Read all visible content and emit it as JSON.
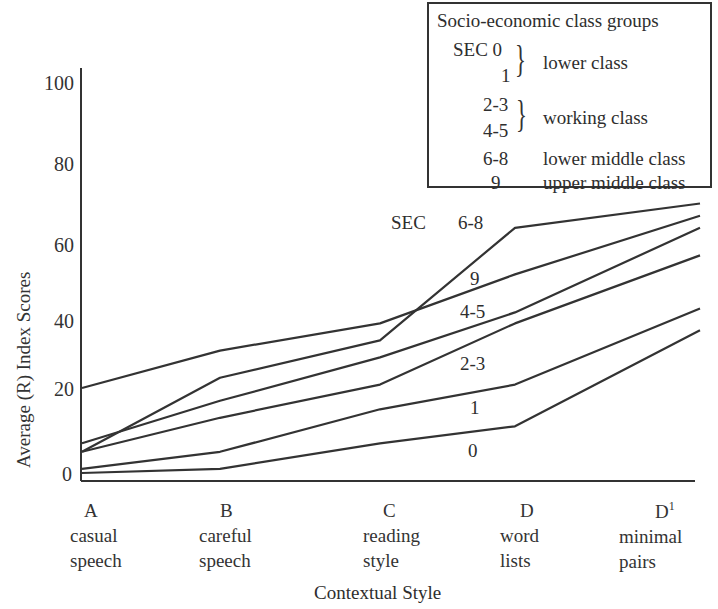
{
  "chart_data": {
    "type": "line",
    "title": "",
    "xlabel": "Contextual Style",
    "ylabel": "Average (R) Index Scores",
    "ylim": [
      0,
      100
    ],
    "yticks": [
      "0",
      "20",
      "40",
      "60",
      "80",
      "100"
    ],
    "grid": false,
    "categories": [
      "A",
      "B",
      "C",
      "D",
      "D1"
    ],
    "category_labels": [
      {
        "letter": "A",
        "line1": "casual",
        "line2": "speech"
      },
      {
        "letter": "B",
        "line1": "careful",
        "line2": "speech"
      },
      {
        "letter": "C",
        "line1": "reading",
        "line2": "style"
      },
      {
        "letter": "D",
        "line1": "word",
        "line2": "lists"
      },
      {
        "letter": "D",
        "sup": "1",
        "line1": "minimal",
        "line2": "pairs"
      }
    ],
    "series": [
      {
        "name": "0",
        "values": [
          0,
          1,
          7,
          11,
          37
        ]
      },
      {
        "name": "1",
        "values": [
          1,
          5,
          15,
          21,
          43
        ]
      },
      {
        "name": "2-3",
        "values": [
          5,
          13,
          21,
          39,
          57
        ]
      },
      {
        "name": "4-5",
        "values": [
          7,
          17,
          29,
          42,
          64
        ]
      },
      {
        "name": "6-8",
        "values": [
          5,
          23,
          34,
          64,
          70
        ]
      },
      {
        "name": "9",
        "values": [
          20,
          31,
          39,
          52,
          67
        ]
      }
    ],
    "annotations": {
      "sec_label": "SEC",
      "series_labels": [
        "6-8",
        "9",
        "4-5",
        "2-3",
        "1",
        "0"
      ]
    },
    "legend": {
      "position": "top-right",
      "title": "Socio-economic class groups",
      "entries": [
        {
          "codes": [
            "SEC 0",
            "1"
          ],
          "group": "lower class"
        },
        {
          "codes": [
            "2-3",
            "4-5"
          ],
          "group": "working class"
        },
        {
          "codes": [
            "6-8"
          ],
          "group": "lower middle class"
        },
        {
          "codes": [
            "9"
          ],
          "group": "upper middle class"
        }
      ]
    }
  }
}
